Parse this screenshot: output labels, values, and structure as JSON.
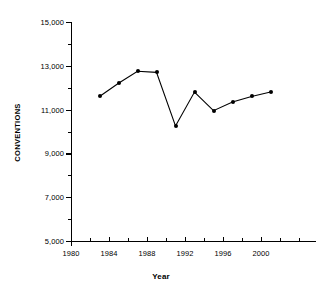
{
  "chart_data": {
    "type": "line",
    "title": "",
    "xlabel": "Year",
    "ylabel": "CONVENTIONS",
    "x": [
      1983,
      1985,
      1987,
      1989,
      1991,
      1993,
      1995,
      1997,
      1999,
      2001
    ],
    "values": [
      11600,
      12200,
      12750,
      12700,
      10250,
      11800,
      10950,
      11350,
      11600,
      11800
    ],
    "series": [
      {
        "name": "Conventions",
        "values": [
          11600,
          12200,
          12750,
          12700,
          10250,
          11800,
          10950,
          11350,
          11600,
          11800
        ]
      }
    ],
    "xlim": [
      1980,
      2002
    ],
    "ylim": [
      5000,
      15000
    ],
    "ytick_labels": [
      "15,000",
      "13,000",
      "11,000",
      "9,000",
      "7,000",
      "5,000"
    ],
    "ytick_values": [
      15000,
      13000,
      11000,
      9000,
      7000,
      5000
    ],
    "yminor_values": [
      14000,
      12000,
      10000,
      8000,
      6000
    ],
    "xtick_labels": [
      "1980",
      "1984",
      "1988",
      "1992",
      "1996",
      "2000"
    ],
    "xtick_values": [
      1980,
      1984,
      1988,
      1992,
      1996,
      2000
    ],
    "xminor_values": [
      1982,
      1986,
      1990,
      1994,
      1998,
      2002
    ],
    "grid": false,
    "legend": false,
    "marker": "filled-circle",
    "line_color": "#000000",
    "marker_color": "#000000"
  }
}
